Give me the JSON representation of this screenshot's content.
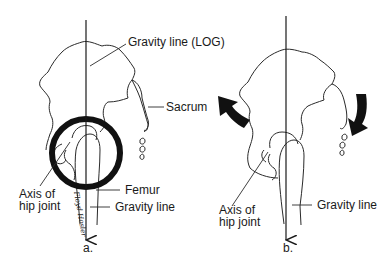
{
  "panels": [
    {
      "id": "a",
      "caption": "a.",
      "labels": {
        "gravity_line_log": "Gravity line (LOG)",
        "sacrum": "Sacrum",
        "axis_hip_joint_line1": "Axis of",
        "axis_hip_joint_line2": "hip joint",
        "femur": "Femur",
        "gravity_line": "Gravity line"
      },
      "highlight": "circle around hip joint",
      "signature": "Floyd Hosler"
    },
    {
      "id": "b",
      "caption": "b.",
      "labels": {
        "axis_hip_joint_line1": "Axis of",
        "axis_hip_joint_line2": "hip joint",
        "gravity_line": "Gravity line"
      },
      "rotation_arrows": [
        "upward-left curved arrow",
        "downward-right curved arrow"
      ]
    }
  ],
  "colors": {
    "ink": "#1a1a1a",
    "background": "#ffffff"
  }
}
